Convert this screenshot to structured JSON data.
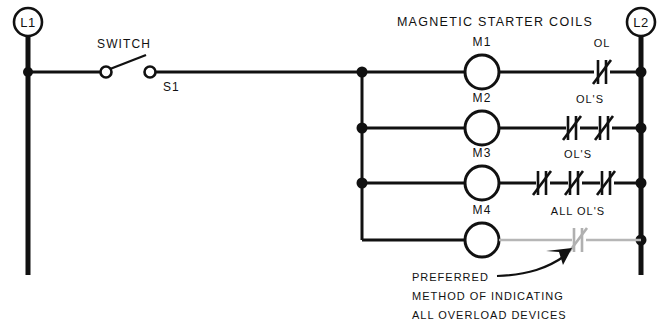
{
  "diagram": {
    "title_header": "MAGNETIC STARTER COILS",
    "left_rail_label": "L1",
    "right_rail_label": "L2",
    "switch": {
      "name_label": "SWITCH",
      "designation_label": "S1",
      "state": "open"
    },
    "rungs": [
      {
        "coil_label": "M1",
        "overload_label": "OL",
        "overload_count": 1,
        "style": "solid"
      },
      {
        "coil_label": "M2",
        "overload_label": "OL'S",
        "overload_count": 2,
        "style": "solid"
      },
      {
        "coil_label": "M3",
        "overload_label": "OL'S",
        "overload_count": 3,
        "style": "solid"
      },
      {
        "coil_label": "M4",
        "overload_label": "ALL OL'S",
        "overload_count": 1,
        "style": "gray"
      }
    ],
    "annotation": {
      "line1": "PREFERRED",
      "line2": "METHOD OF INDICATING",
      "line3": "ALL OVERLOAD DEVICES"
    },
    "colors": {
      "line": "#111111",
      "gray_line": "#b6b6b6",
      "background": "#ffffff"
    }
  }
}
